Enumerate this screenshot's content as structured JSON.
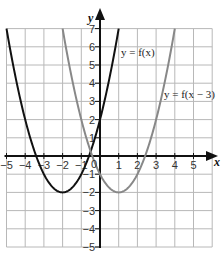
{
  "chart_data": {
    "type": "line",
    "title": "",
    "xlabel": "x",
    "ylabel": "y",
    "xlim": [
      -5,
      6
    ],
    "ylim": [
      -5,
      7
    ],
    "grid": true,
    "x_ticks": [
      -5,
      -4,
      -3,
      -2,
      -1,
      1,
      2,
      3,
      4,
      5
    ],
    "y_ticks": [
      -5,
      -4,
      -3,
      -2,
      -1,
      1,
      2,
      3,
      4,
      5,
      6,
      7
    ],
    "origin_label": "0",
    "series": [
      {
        "name": "y = f(x)",
        "color": "#111111",
        "formula": "(x+2)^2 - 2",
        "vertex": [
          -2,
          -2
        ],
        "points": [
          [
            -5,
            7
          ],
          [
            -4,
            2
          ],
          [
            -3,
            -1
          ],
          [
            -2,
            -2
          ],
          [
            -1,
            -1
          ],
          [
            0,
            2
          ],
          [
            1,
            7
          ]
        ]
      },
      {
        "name": "y = f(x − 3)",
        "color": "#888888",
        "formula": "(x-1)^2 - 2",
        "vertex": [
          1,
          -2
        ],
        "points": [
          [
            -2,
            7
          ],
          [
            -1,
            2
          ],
          [
            0,
            -1
          ],
          [
            1,
            -2
          ],
          [
            2,
            -1
          ],
          [
            3,
            2
          ],
          [
            4,
            7
          ]
        ]
      }
    ],
    "annotations": [
      {
        "text": "y = f(x)",
        "near": [
          1.1,
          5.7
        ]
      },
      {
        "text": "y = f(x − 3)",
        "near": [
          3.3,
          3.4
        ]
      }
    ]
  },
  "labels": {
    "x_axis": "x",
    "y_axis": "y",
    "curve1": "y = f(x)",
    "curve2": "y = f(x − 3)",
    "origin": "0"
  }
}
